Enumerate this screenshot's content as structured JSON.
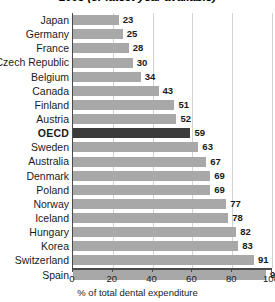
{
  "chart_data": {
    "type": "bar",
    "orientation": "horizontal",
    "title": "2005 (or latest year available)",
    "xlabel": "% of total dental expenditure",
    "ylabel": "",
    "xlim": [
      0,
      100
    ],
    "xticks": [
      0,
      20,
      40,
      60,
      80,
      100
    ],
    "grid": true,
    "legend": "none",
    "highlight_category": "OECD",
    "colors": {
      "bar": "#a8a8a8",
      "bar_highlight": "#3b3b3b",
      "axis": "#4a4a4a",
      "gridline": "#d2d2d2",
      "text": "#1a1a1a",
      "background": "#ffffff"
    },
    "categories": [
      "Japan",
      "Germany",
      "France",
      "Czech Republic",
      "Belgium",
      "Canada",
      "Finland",
      "Austria",
      "OECD",
      "Sweden",
      "Australia",
      "Denmark",
      "Poland",
      "Norway",
      "Iceland",
      "Hungary",
      "Korea",
      "Switzerland",
      "Spain"
    ],
    "values": [
      23,
      25,
      28,
      30,
      34,
      43,
      51,
      52,
      59,
      63,
      67,
      69,
      69,
      77,
      78,
      82,
      83,
      91,
      97
    ],
    "rows": [
      {
        "label": "Japan",
        "value": 23,
        "value_text": "23",
        "highlight": false
      },
      {
        "label": "Germany",
        "value": 25,
        "value_text": "25",
        "highlight": false
      },
      {
        "label": "France",
        "value": 28,
        "value_text": "28",
        "highlight": false
      },
      {
        "label": "Czech Republic",
        "value": 30,
        "value_text": "30",
        "highlight": false
      },
      {
        "label": "Belgium",
        "value": 34,
        "value_text": "34",
        "highlight": false
      },
      {
        "label": "Canada",
        "value": 43,
        "value_text": "43",
        "highlight": false
      },
      {
        "label": "Finland",
        "value": 51,
        "value_text": "51",
        "highlight": false
      },
      {
        "label": "Austria",
        "value": 52,
        "value_text": "52",
        "highlight": false
      },
      {
        "label": "OECD",
        "value": 59,
        "value_text": "59",
        "highlight": true
      },
      {
        "label": "Sweden",
        "value": 63,
        "value_text": "63",
        "highlight": false
      },
      {
        "label": "Australia",
        "value": 67,
        "value_text": "67",
        "highlight": false
      },
      {
        "label": "Denmark",
        "value": 69,
        "value_text": "69",
        "highlight": false
      },
      {
        "label": "Poland",
        "value": 69,
        "value_text": "69",
        "highlight": false
      },
      {
        "label": "Norway",
        "value": 77,
        "value_text": "77",
        "highlight": false
      },
      {
        "label": "Iceland",
        "value": 78,
        "value_text": "78",
        "highlight": false
      },
      {
        "label": "Hungary",
        "value": 82,
        "value_text": "82",
        "highlight": false
      },
      {
        "label": "Korea",
        "value": 83,
        "value_text": "83",
        "highlight": false
      },
      {
        "label": "Switzerland",
        "value": 91,
        "value_text": "91",
        "highlight": false
      },
      {
        "label": "Spain",
        "value": 97,
        "value_text": "97",
        "highlight": false
      }
    ],
    "xtick_labels": [
      "0",
      "20",
      "40",
      "60",
      "80",
      "100"
    ]
  }
}
